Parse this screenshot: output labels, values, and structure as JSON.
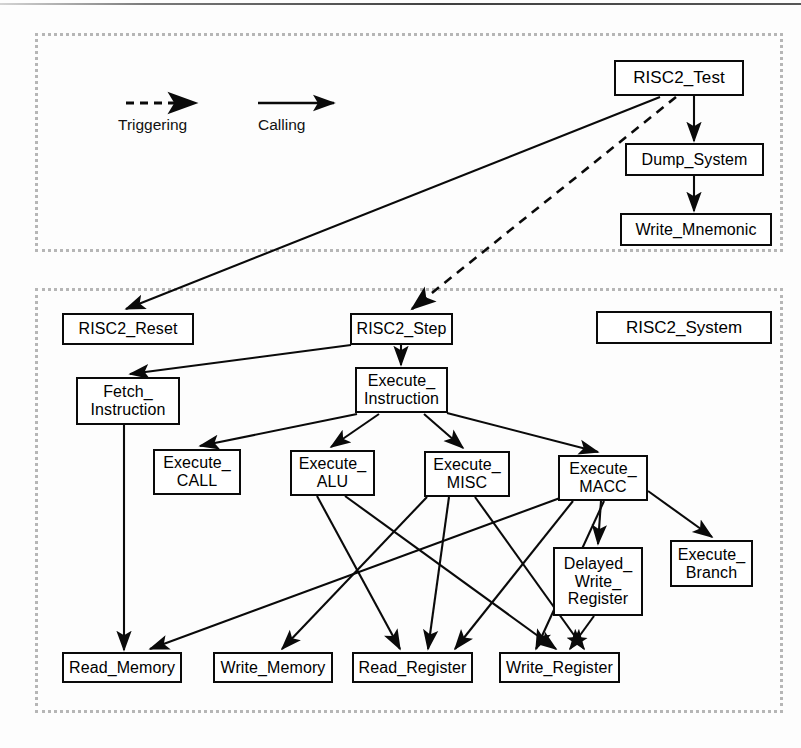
{
  "diagram": {
    "legend": {
      "triggering_label": "Triggering",
      "calling_label": "Calling",
      "triggering_style": "dashed-arrow",
      "calling_style": "solid-arrow"
    },
    "panels": [
      {
        "id": "test-panel",
        "label": "",
        "x": 35,
        "y": 33,
        "w": 748,
        "h": 219
      },
      {
        "id": "system-panel",
        "label": "RISC2_System",
        "x": 35,
        "y": 288,
        "w": 748,
        "h": 425
      }
    ],
    "group_label": {
      "text": "RISC2_System",
      "x": 596,
      "y": 311,
      "w": 176,
      "h": 33
    },
    "nodes": [
      {
        "id": "risc2_test",
        "label": "RISC2_Test",
        "x": 614,
        "y": 60,
        "w": 130,
        "h": 36,
        "fontsize": 17
      },
      {
        "id": "dump_system",
        "label": "Dump_System",
        "x": 625,
        "y": 143,
        "w": 139,
        "h": 33,
        "fontsize": 16
      },
      {
        "id": "write_mnemonic",
        "label": "Write_Mnemonic",
        "x": 620,
        "y": 213,
        "w": 152,
        "h": 33,
        "fontsize": 16
      },
      {
        "id": "risc2_reset",
        "label": "RISC2_Reset",
        "x": 62,
        "y": 313,
        "w": 132,
        "h": 32,
        "fontsize": 16
      },
      {
        "id": "risc2_step",
        "label": "RISC2_Step",
        "x": 350,
        "y": 313,
        "w": 103,
        "h": 32,
        "fontsize": 16
      },
      {
        "id": "fetch_instruction",
        "label": "Fetch_\nInstruction",
        "x": 76,
        "y": 377,
        "w": 104,
        "h": 48,
        "fontsize": 16
      },
      {
        "id": "execute_instruction",
        "label": "Execute_\nInstruction",
        "x": 355,
        "y": 367,
        "w": 93,
        "h": 46,
        "fontsize": 16
      },
      {
        "id": "execute_call",
        "label": "Execute_\nCALL",
        "x": 153,
        "y": 449,
        "w": 88,
        "h": 46,
        "fontsize": 16
      },
      {
        "id": "execute_alu",
        "label": "Execute_\nALU",
        "x": 290,
        "y": 450,
        "w": 85,
        "h": 46,
        "fontsize": 16
      },
      {
        "id": "execute_misc",
        "label": "Execute_\nMISC",
        "x": 424,
        "y": 451,
        "w": 86,
        "h": 46,
        "fontsize": 16
      },
      {
        "id": "execute_macc",
        "label": "Execute_\nMACC",
        "x": 558,
        "y": 455,
        "w": 90,
        "h": 46,
        "fontsize": 16
      },
      {
        "id": "delayed_write_register",
        "label": "Delayed_\nWrite_\nRegister",
        "x": 553,
        "y": 547,
        "w": 90,
        "h": 69,
        "fontsize": 16
      },
      {
        "id": "execute_branch",
        "label": "Execute_\nBranch",
        "x": 670,
        "y": 540,
        "w": 83,
        "h": 47,
        "fontsize": 16
      },
      {
        "id": "read_memory",
        "label": "Read_Memory",
        "x": 62,
        "y": 652,
        "w": 120,
        "h": 31,
        "fontsize": 16
      },
      {
        "id": "write_memory",
        "label": "Write_Memory",
        "x": 213,
        "y": 652,
        "w": 120,
        "h": 31,
        "fontsize": 16
      },
      {
        "id": "read_register",
        "label": "Read_Register",
        "x": 352,
        "y": 652,
        "w": 121,
        "h": 31,
        "fontsize": 16
      },
      {
        "id": "write_register",
        "label": "Write_Register",
        "x": 499,
        "y": 652,
        "w": 121,
        "h": 31,
        "fontsize": 16
      }
    ],
    "edges": [
      {
        "from": "risc2_test",
        "to": "risc2_reset",
        "type": "calling"
      },
      {
        "from": "risc2_test",
        "to": "risc2_step",
        "type": "triggering"
      },
      {
        "from": "risc2_test",
        "to": "dump_system",
        "type": "calling"
      },
      {
        "from": "dump_system",
        "to": "write_mnemonic",
        "type": "calling"
      },
      {
        "from": "risc2_step",
        "to": "fetch_instruction",
        "type": "calling"
      },
      {
        "from": "risc2_step",
        "to": "execute_instruction",
        "type": "calling"
      },
      {
        "from": "execute_instruction",
        "to": "execute_call",
        "type": "calling"
      },
      {
        "from": "execute_instruction",
        "to": "execute_alu",
        "type": "calling"
      },
      {
        "from": "execute_instruction",
        "to": "execute_misc",
        "type": "calling"
      },
      {
        "from": "execute_instruction",
        "to": "execute_macc",
        "type": "calling"
      },
      {
        "from": "fetch_instruction",
        "to": "read_memory",
        "type": "calling"
      },
      {
        "from": "execute_alu",
        "to": "read_register",
        "type": "calling"
      },
      {
        "from": "execute_alu",
        "to": "write_register",
        "type": "calling"
      },
      {
        "from": "execute_misc",
        "to": "read_register",
        "type": "calling"
      },
      {
        "from": "execute_misc",
        "to": "write_register",
        "type": "calling"
      },
      {
        "from": "execute_misc",
        "to": "write_memory",
        "type": "calling"
      },
      {
        "from": "execute_macc",
        "to": "read_register",
        "type": "calling"
      },
      {
        "from": "execute_macc",
        "to": "write_register",
        "type": "calling"
      },
      {
        "from": "execute_macc",
        "to": "read_memory",
        "type": "calling"
      },
      {
        "from": "execute_macc",
        "to": "delayed_write_register",
        "type": "calling"
      },
      {
        "from": "execute_macc",
        "to": "execute_branch",
        "type": "calling"
      },
      {
        "from": "delayed_write_register",
        "to": "write_register",
        "type": "calling"
      }
    ]
  }
}
